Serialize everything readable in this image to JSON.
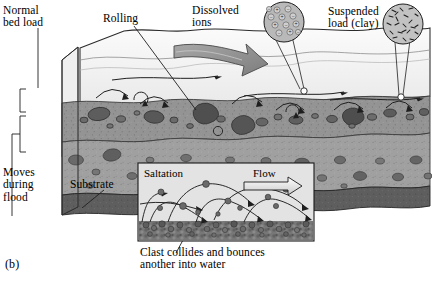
{
  "figure": {
    "label": "(b)",
    "kind": "sediment-transport-block-diagram"
  },
  "labels": {
    "normal_bed_load": "Normal\nbed load",
    "rolling": "Rolling",
    "dissolved_ions": "Dissolved\nions",
    "suspended_load": "Suspended\nload (clay)",
    "moves_during_flood": "Moves\nduring\nflood",
    "substrate": "Substrate"
  },
  "inset": {
    "title": "Saltation",
    "flow": "Flow",
    "caption": "Clast collides and bounces\nanother into water"
  },
  "magnifiers": [
    {
      "name": "dissolved-ions-detail",
      "symbols": [
        "+",
        "−"
      ],
      "depicts": "charged ions in solution"
    },
    {
      "name": "suspended-clay-detail",
      "depicts": "clay flakes suspended in water"
    }
  ],
  "colors": {
    "water": "#f1f1f1",
    "water_deep": "#dcdcdc",
    "bed_load_layer": "#8f8f8f",
    "flood_layer": "#9c9c9c",
    "substrate": "#5e5e5e",
    "clast": "#6b6b6b",
    "clast_dark": "#4f4f4f",
    "arrow_fill": "#8a8a8a",
    "inset_bg": "#e3e3e3",
    "inset_bed": "#707070",
    "line": "#1a1a1a"
  }
}
